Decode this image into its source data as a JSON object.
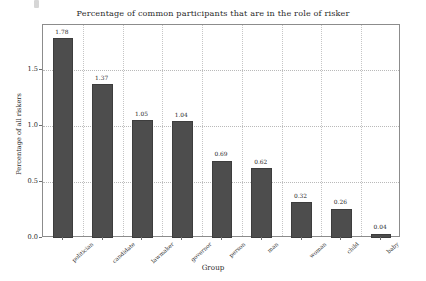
{
  "chart_data": {
    "type": "bar",
    "title": "Percentage of common participants that are in the role of risker",
    "xlabel": "Group",
    "ylabel": "Percentage of all riskers",
    "categories": [
      "politician",
      "candidate",
      "lawmaker",
      "governor",
      "person",
      "man",
      "woman",
      "child",
      "baby"
    ],
    "values": [
      1.78,
      1.37,
      1.05,
      1.04,
      0.69,
      0.62,
      0.32,
      0.26,
      0.04
    ],
    "value_labels": [
      "1.78",
      "1.37",
      "1.05",
      "1.04",
      "0.69",
      "0.62",
      "0.32",
      "0.26",
      "0.04"
    ],
    "ylim": [
      0,
      1.9
    ],
    "yticks": [
      0.0,
      0.5,
      1.0,
      1.5
    ],
    "ytick_labels": [
      "0.0",
      "0.5",
      "1.0",
      "1.5"
    ],
    "grid": true,
    "legend": null,
    "bar_color": "#4d4d4d",
    "background_color": "#ffffff"
  }
}
